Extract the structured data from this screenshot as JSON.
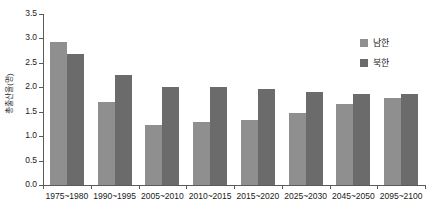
{
  "chart_data": {
    "type": "bar",
    "title": "",
    "xlabel": "",
    "ylabel": "총출산율(명)",
    "ylim": [
      0.0,
      3.5
    ],
    "ytick_labels": [
      "0.0",
      "0.5",
      "1.0",
      "1.5",
      "2.0",
      "2.5",
      "3.0",
      "3.5"
    ],
    "ytick_values": [
      0.0,
      0.5,
      1.0,
      1.5,
      2.0,
      2.5,
      3.0,
      3.5
    ],
    "grid": false,
    "legend_position": "top-right",
    "categories": [
      "1975~1980",
      "1990~1995",
      "2005~2010",
      "2010~2015",
      "2015~2020",
      "2025~2030",
      "2045~2050",
      "2095~2100"
    ],
    "series": [
      {
        "name": "남한",
        "color": "#8f8f8f",
        "values": [
          2.93,
          1.7,
          1.23,
          1.28,
          1.33,
          1.48,
          1.65,
          1.79
        ]
      },
      {
        "name": "북한",
        "color": "#6b6b6b",
        "values": [
          2.69,
          2.26,
          2.0,
          2.01,
          1.96,
          1.9,
          1.86,
          1.87
        ]
      }
    ]
  }
}
